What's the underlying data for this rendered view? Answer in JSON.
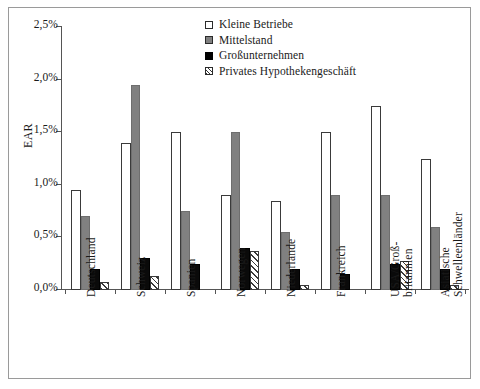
{
  "chart_data": {
    "type": "bar",
    "title": "",
    "subtitle": "",
    "xlabel": "",
    "ylabel": "EAR",
    "ylim": [
      0,
      2.5
    ],
    "ytick_labels": [
      "0,0%",
      "0,5%",
      "1,0%",
      "1,5%",
      "2,0%",
      "2,5%"
    ],
    "ytick_values": [
      0,
      0.5,
      1.0,
      1.5,
      2.0,
      2.5
    ],
    "grid": false,
    "legend_position": "top-right",
    "value_unit": "%",
    "categories": [
      "Deutschland",
      "Schweiz",
      "Spanien",
      "Norwegen",
      "Niederlande",
      "Frankreich",
      "USA/Großbritannien",
      "Asiatische Schwellenländer"
    ],
    "category_lines": [
      [
        "Deutschland"
      ],
      [
        "Schweiz"
      ],
      [
        "Spanien"
      ],
      [
        "Norwegen"
      ],
      [
        "Niederlande"
      ],
      [
        "Frankreich"
      ],
      [
        "USA/Groß-",
        "britannien"
      ],
      [
        "Asiatische",
        "Schwelleenländer"
      ]
    ],
    "series": [
      {
        "name": "Kleine Betriebe",
        "fill": "white",
        "color": "#ffffff",
        "values": [
          0.95,
          1.4,
          1.5,
          0.9,
          0.85,
          1.5,
          1.75,
          1.25
        ]
      },
      {
        "name": "Mittelstand",
        "fill": "gray",
        "color": "#808080",
        "values": [
          0.7,
          1.95,
          0.75,
          1.5,
          0.55,
          0.9,
          0.9,
          0.6
        ]
      },
      {
        "name": "Großunternehmen",
        "fill": "black",
        "color": "#000000",
        "values": [
          0.2,
          0.3,
          0.25,
          0.4,
          0.2,
          0.15,
          0.25,
          0.2
        ]
      },
      {
        "name": "Privates Hypothekengeschäft",
        "fill": "hatched",
        "color": "#ffffff",
        "values": [
          0.08,
          0.13,
          0.0,
          0.37,
          0.05,
          0.0,
          0.28,
          0.05
        ]
      }
    ]
  },
  "legend": {
    "items": [
      {
        "label": "Kleine Betriebe",
        "swatch": "white-square-icon"
      },
      {
        "label": "Mittelstand",
        "swatch": "gray-square-icon"
      },
      {
        "label": "Großunternehmen",
        "swatch": "black-square-icon"
      },
      {
        "label": "Privates Hypothekengeschäft",
        "swatch": "hatched-square-icon"
      }
    ]
  }
}
